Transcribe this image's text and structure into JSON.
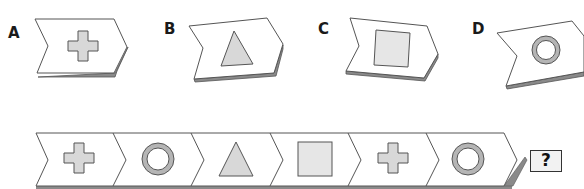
{
  "puzzle": {
    "top_text": "",
    "options": [
      {
        "label": "A",
        "shape": "cross"
      },
      {
        "label": "B",
        "shape": "triangle"
      },
      {
        "label": "C",
        "shape": "square"
      },
      {
        "label": "D",
        "shape": "ring"
      }
    ],
    "sequence": [
      "cross",
      "ring",
      "triangle",
      "square",
      "cross",
      "ring"
    ],
    "question_mark": "?",
    "colors": {
      "shape_fill": "#d8d8d8",
      "shape_stroke": "#555555",
      "ring_fill": "#b5b5b5",
      "chevron_stroke": "#555555",
      "chevron_shadow": "#8a8a8a"
    }
  }
}
